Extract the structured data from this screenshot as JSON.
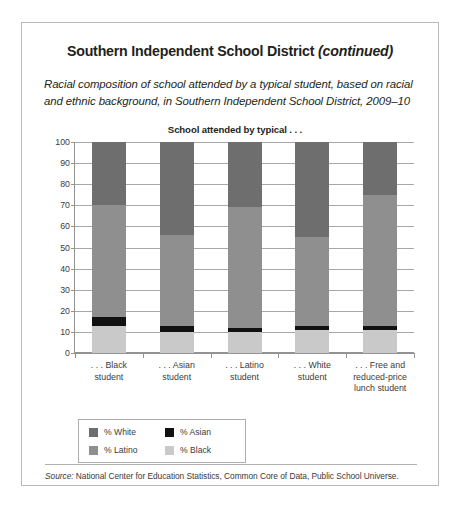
{
  "page": {
    "title_main": "Southern Independent School District ",
    "title_continued": "(continued)",
    "subtitle": "Racial composition of school attended by a typical student, based on racial and ethnic background, in Southern Independent School District, 2009–10",
    "source_prefix": "Source:",
    "source_text": " National Center for Education Statistics, Common Core of Data, Public School Universe."
  },
  "legend": {
    "items": [
      {
        "label": "% White",
        "color": "#6e6e6e"
      },
      {
        "label": "% Asian",
        "color": "#111111"
      },
      {
        "label": "% Latino",
        "color": "#8f8f8f"
      },
      {
        "label": "% Black",
        "color": "#c9c9c9"
      }
    ]
  },
  "colors": {
    "white_pct": "#6e6e6e",
    "asian_pct": "#111111",
    "latino_pct": "#8f8f8f",
    "black_pct": "#c9c9c9",
    "gridline": "#a8a8a8",
    "axis": "#939393",
    "frame": "#b9b9b9",
    "text": "#231f20"
  },
  "chart_data": {
    "type": "bar",
    "stacked": true,
    "title": "School attended by typical . . .",
    "xlabel": "",
    "ylabel": "",
    "ylim": [
      0,
      100
    ],
    "yticks": [
      0,
      10,
      20,
      30,
      40,
      50,
      60,
      70,
      80,
      90,
      100
    ],
    "ytick_labels": [
      "0",
      "10",
      "20",
      "30",
      "40",
      "50",
      "60",
      "70",
      "80",
      "90",
      "100"
    ],
    "grid": true,
    "legend_position": "bottom-left",
    "categories": [
      ". . . Black\nstudent",
      ". . . Asian\nstudent",
      ". . . Latino\nstudent",
      ". . . White\nstudent",
      ". . . Free and\nreduced-price\nlunch student"
    ],
    "category_lines": [
      [
        ". . . Black",
        "student"
      ],
      [
        ". . . Asian",
        "student"
      ],
      [
        ". . . Latino",
        "student"
      ],
      [
        ". . . White",
        "student"
      ],
      [
        ". . . Free and",
        "reduced-price",
        "lunch student"
      ]
    ],
    "series": [
      {
        "name": "% Black",
        "color": "#c9c9c9",
        "values": [
          13,
          10,
          10,
          11,
          11
        ]
      },
      {
        "name": "% Asian",
        "color": "#111111",
        "values": [
          4,
          3,
          2,
          2,
          2
        ]
      },
      {
        "name": "% Latino",
        "color": "#8f8f8f",
        "values": [
          53,
          43,
          57,
          42,
          62
        ]
      },
      {
        "name": "% White",
        "color": "#6e6e6e",
        "values": [
          30,
          44,
          31,
          45,
          25
        ]
      }
    ],
    "stack_order_bottom_to_top": [
      "% Black",
      "% Asian",
      "% Latino",
      "% White"
    ]
  }
}
